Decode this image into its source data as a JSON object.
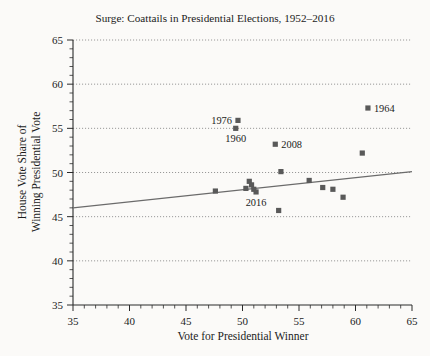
{
  "chart_data": {
    "type": "scatter",
    "title": "Surge: Coattails in Presidential Elections, 1952–2016",
    "xlabel": "Vote for Presidential Winner",
    "ylabel_line1": "House Vote Share of",
    "ylabel_line2": "Winning Presidential Vote",
    "xlim": [
      35,
      65
    ],
    "ylim": [
      35,
      65
    ],
    "xticks": [
      35,
      40,
      45,
      50,
      55,
      60,
      65
    ],
    "yticks": [
      35,
      40,
      45,
      50,
      55,
      60,
      65
    ],
    "xtick_labels": [
      "35",
      "40",
      "45",
      "50",
      "55",
      "60",
      "65"
    ],
    "ytick_labels": [
      "35",
      "40",
      "45",
      "50",
      "55",
      "60",
      "65"
    ],
    "minor_tick_step": 1,
    "grid": "horizontal-dotted",
    "legend": "none",
    "marker_color": "#595959",
    "fitline_color": "#6b6b6b",
    "background_color": "#fbfaf8",
    "points": [
      {
        "x": 49.6,
        "y": 55.9,
        "label": "1976",
        "label_pos": "left"
      },
      {
        "x": 49.4,
        "y": 55.0,
        "label": "1960",
        "label_pos": "below"
      },
      {
        "x": 52.9,
        "y": 53.2,
        "label": "2008",
        "label_pos": "right"
      },
      {
        "x": 61.1,
        "y": 57.3,
        "label": "1964",
        "label_pos": "right"
      },
      {
        "x": 53.4,
        "y": 50.1,
        "label": "",
        "label_pos": ""
      },
      {
        "x": 50.6,
        "y": 49.0,
        "label": "",
        "label_pos": ""
      },
      {
        "x": 50.8,
        "y": 48.6,
        "label": "",
        "label_pos": ""
      },
      {
        "x": 50.3,
        "y": 48.2,
        "label": "",
        "label_pos": ""
      },
      {
        "x": 51.0,
        "y": 48.1,
        "label": "",
        "label_pos": ""
      },
      {
        "x": 47.6,
        "y": 47.9,
        "label": "",
        "label_pos": ""
      },
      {
        "x": 55.9,
        "y": 49.1,
        "label": "",
        "label_pos": ""
      },
      {
        "x": 60.6,
        "y": 52.2,
        "label": "",
        "label_pos": ""
      },
      {
        "x": 57.1,
        "y": 48.3,
        "label": "",
        "label_pos": ""
      },
      {
        "x": 58.0,
        "y": 48.1,
        "label": "",
        "label_pos": ""
      },
      {
        "x": 58.9,
        "y": 47.2,
        "label": "",
        "label_pos": ""
      },
      {
        "x": 53.2,
        "y": 45.7,
        "label": "",
        "label_pos": ""
      },
      {
        "x": 51.2,
        "y": 47.8,
        "label": "2016",
        "label_pos": "below"
      }
    ],
    "fitline": {
      "x0": 35,
      "y0": 46.0,
      "x1": 65,
      "y1": 50.1
    }
  }
}
